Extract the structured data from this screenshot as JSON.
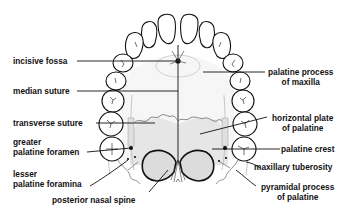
{
  "diagram": {
    "colors": {
      "ink": "#111111",
      "shading": "#d8d8d8",
      "background": "#ffffff"
    },
    "labels_left": [
      {
        "id": "incisive-fossa",
        "lines": [
          "incisive fossa"
        ]
      },
      {
        "id": "median-suture",
        "lines": [
          "median suture"
        ]
      },
      {
        "id": "transverse-suture",
        "lines": [
          "transverse suture"
        ]
      },
      {
        "id": "greater-palatine-foramen",
        "lines": [
          "greater",
          "palatine foramen"
        ]
      },
      {
        "id": "lesser-palatine-foramina",
        "lines": [
          "lesser",
          "palatine foramina"
        ]
      }
    ],
    "labels_right": [
      {
        "id": "palatine-process-of-maxilla",
        "lines": [
          "palatine process",
          "of maxilla"
        ]
      },
      {
        "id": "horizontal-plate-of-palatine",
        "lines": [
          "horizontal plate",
          "of palatine"
        ]
      },
      {
        "id": "palatine-crest",
        "lines": [
          "palatine crest"
        ]
      },
      {
        "id": "maxillary-tuberosity",
        "lines": [
          "maxillary tuberosity"
        ]
      },
      {
        "id": "pyramidal-process-of-palatine",
        "lines": [
          "pyramidal process",
          "of palatine"
        ]
      }
    ],
    "labels_bottom": [
      {
        "id": "posterior-nasal-spine",
        "lines": [
          "posterior nasal spine"
        ]
      }
    ]
  }
}
